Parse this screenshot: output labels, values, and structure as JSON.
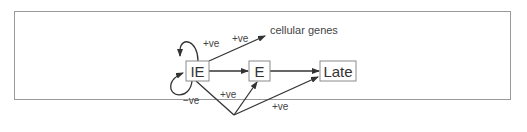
{
  "diagram": {
    "nodes": {
      "ie": {
        "label": "IE"
      },
      "e": {
        "label": "E"
      },
      "late": {
        "label": "Late"
      },
      "cellular": {
        "label": "cellular genes"
      }
    },
    "edges": {
      "ie_self_positive": {
        "from": "IE",
        "to": "IE",
        "label": "+ve"
      },
      "ie_self_negative": {
        "from": "IE",
        "to": "IE",
        "label": "−ve"
      },
      "ie_to_cellular": {
        "from": "IE",
        "to": "cellular genes",
        "label": "+ve"
      },
      "ie_to_e": {
        "from": "IE",
        "to": "E",
        "label": ""
      },
      "e_to_late": {
        "from": "E",
        "to": "Late",
        "label": ""
      },
      "ie_via_junction_to_e": {
        "from": "IE",
        "to": "E",
        "label": "+ve"
      },
      "ie_via_junction_to_late": {
        "from": "IE",
        "to": "Late",
        "label": "+ve"
      }
    },
    "colors": {
      "stroke": "#333333",
      "box_border": "#8a8a8a",
      "frame_border": "#9a9a9a",
      "text": "#444444"
    }
  }
}
